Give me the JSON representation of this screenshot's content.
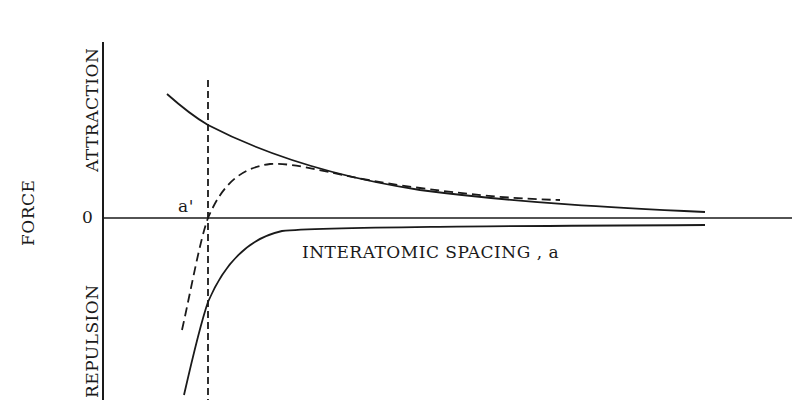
{
  "diagram": {
    "type": "force-vs-interatomic-spacing",
    "y_axis_label": "FORCE",
    "y_positive_label": "ATTRACTION",
    "y_negative_label": "REPULSION",
    "x_axis_label": "INTERATOMIC SPACING , a",
    "origin_label": "0",
    "equilibrium_label": "a'",
    "curves": [
      {
        "name": "attraction-force",
        "style": "solid"
      },
      {
        "name": "repulsion-force",
        "style": "solid"
      },
      {
        "name": "net-force",
        "style": "dashed"
      }
    ],
    "marker": {
      "name": "equilibrium-spacing-line",
      "style": "dashed",
      "at": "a'"
    },
    "colors": {
      "ink": "#1a1a1a",
      "background": "#ffffff"
    }
  }
}
